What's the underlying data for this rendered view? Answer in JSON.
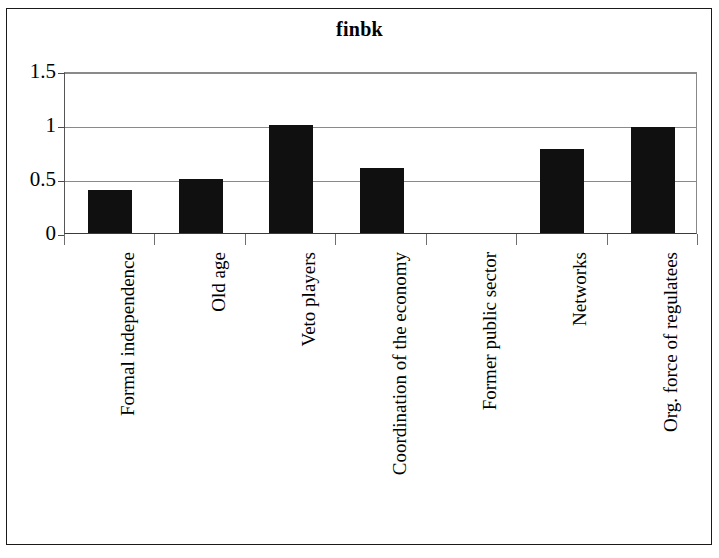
{
  "chart_data": {
    "type": "bar",
    "title": "finbk",
    "xlabel": "",
    "ylabel": "",
    "categories": [
      "Formal independence",
      "Old age",
      "Veto players",
      "Coordination of the economy",
      "Former public sector",
      "Networks",
      "Org. force of regulatees"
    ],
    "values": [
      0.4,
      0.5,
      1.0,
      0.6,
      0.0,
      0.78,
      0.98
    ],
    "ylim": [
      0,
      1.5
    ],
    "yticks": [
      0,
      0.5,
      1,
      1.5
    ],
    "ytick_labels": [
      "0",
      "0.5",
      "1",
      "1.5"
    ],
    "grid": true,
    "legend": false,
    "bar_color": "#101010",
    "gridline_color": "#8a8a8a",
    "axis_color": "#3b3b3b",
    "background_color": "#ffffff"
  }
}
